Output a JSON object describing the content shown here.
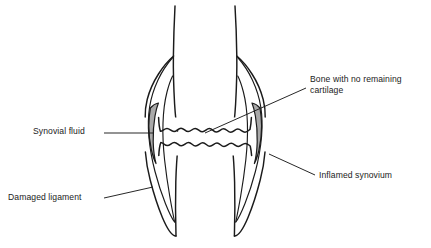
{
  "figure": {
    "width": 431,
    "height": 248,
    "background_color": "#ffffff",
    "line_color": "#1b1b1b",
    "synovium_fill_color": "#a9a9a9"
  },
  "labels": {
    "bone_no_cartilage": "Bone with no remaining cartilage",
    "synovial_fluid": "Synovial fluid",
    "damaged_ligament": "Damaged ligament",
    "inflamed_synovium": "Inflamed synovium"
  },
  "annotations": [
    {
      "name": "bone-no-cartilage",
      "text": "Bone with no remaining cartilage",
      "leader_from": [
        306,
        88
      ],
      "leader_to": [
        205,
        133
      ],
      "text_position": [
        310,
        74
      ]
    },
    {
      "name": "synovial-fluid",
      "text": "Synovial fluid",
      "leader_from": [
        104,
        133
      ],
      "leader_to": [
        154,
        133
      ],
      "text_position": [
        33,
        126
      ]
    },
    {
      "name": "damaged-ligament",
      "text": "Damaged ligament",
      "leader_from": [
        104,
        198
      ],
      "leader_to": [
        153,
        187
      ],
      "text_position": [
        8,
        192
      ]
    },
    {
      "name": "inflamed-synovium",
      "text": "Inflamed synovium",
      "leader_from": [
        315,
        175
      ],
      "leader_to": [
        269,
        154
      ],
      "text_position": [
        319,
        170
      ]
    }
  ],
  "anatomy_parts": [
    {
      "name": "femur-shaft-left",
      "description": "upper left femoral cortex line"
    },
    {
      "name": "femur-shaft-right",
      "description": "upper right femoral cortex line"
    },
    {
      "name": "femoral-condyle-outline",
      "description": "flared distal femur outline"
    },
    {
      "name": "tibia-shaft-left",
      "description": "lower left tibial cortex line"
    },
    {
      "name": "tibia-shaft-right",
      "description": "lower right tibial cortex line"
    },
    {
      "name": "tibial-plateau-outline",
      "description": "flared proximal tibia outline"
    },
    {
      "name": "upper-eroded-bone-surface",
      "description": "scalloped femoral joint surface, no cartilage"
    },
    {
      "name": "lower-eroded-bone-surface",
      "description": "scalloped tibial joint surface, no cartilage"
    },
    {
      "name": "synovium-left",
      "description": "grey crescent of inflamed synovium, left side"
    },
    {
      "name": "synovium-right",
      "description": "grey crescent of inflamed synovium, right side"
    },
    {
      "name": "ligament-left",
      "description": "damaged collateral ligament, left"
    },
    {
      "name": "ligament-right",
      "description": "damaged collateral ligament, right"
    }
  ]
}
